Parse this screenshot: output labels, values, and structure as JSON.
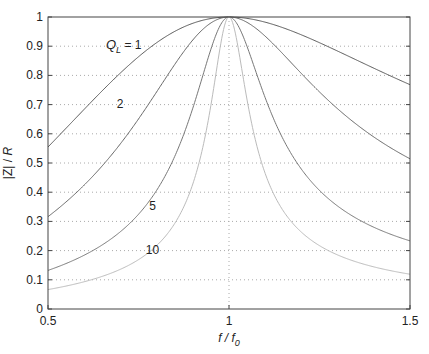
{
  "chart_data": {
    "type": "line",
    "title": "",
    "xlabel": "f / f0",
    "xlabel_main": "f / f",
    "xlabel_sub": "0",
    "ylabel": "|Z| / R",
    "xlim": [
      0.5,
      1.5
    ],
    "ylim": [
      0,
      1
    ],
    "grid": true,
    "legend_position": "inline labels",
    "x_ticks": [
      0.5,
      1,
      1.5
    ],
    "x_tick_labels": [
      "0.5",
      "1",
      "1.5"
    ],
    "y_ticks": [
      0,
      0.1,
      0.2,
      0.3,
      0.4,
      0.5,
      0.6,
      0.7,
      0.8,
      0.9,
      1
    ],
    "y_tick_labels": [
      "0",
      "0.1",
      "0.2",
      "0.3",
      "0.4",
      "0.5",
      "0.6",
      "0.7",
      "0.8",
      "0.9",
      "1"
    ],
    "x": [
      0.5,
      0.6,
      0.7,
      0.8,
      0.9,
      1.0,
      1.1,
      1.2,
      1.3,
      1.4,
      1.5
    ],
    "series": [
      {
        "name": "Q_L = 1",
        "label": "1",
        "Q": 1,
        "color": "#555555",
        "values": [
          0.555,
          0.669,
          0.799,
          0.923,
          0.989,
          1.0,
          0.992,
          0.964,
          0.918,
          0.859,
          0.768
        ]
      },
      {
        "name": "Q_L = 2",
        "label": "2",
        "Q": 2,
        "color": "#666666",
        "values": [
          0.316,
          0.428,
          0.557,
          0.748,
          0.927,
          1.0,
          0.935,
          0.771,
          0.64,
          0.532,
          0.514
        ]
      },
      {
        "name": "Q_L = 5",
        "label": "5",
        "Q": 5,
        "color": "#777777",
        "values": [
          0.132,
          0.187,
          0.27,
          0.421,
          0.689,
          1.0,
          0.722,
          0.497,
          0.326,
          0.255,
          0.233
        ]
      },
      {
        "name": "Q_L = 10",
        "label": "10",
        "Q": 10,
        "color": "#bbbbbb",
        "values": [
          0.066,
          0.094,
          0.139,
          0.229,
          0.426,
          1.0,
          0.463,
          0.259,
          0.191,
          0.139,
          0.119
        ]
      }
    ],
    "annotations": [
      {
        "text_main": "Q",
        "text_sub": "L",
        "text_rest": " = 1",
        "x": 0.66,
        "y": 0.89
      },
      {
        "text": "2",
        "x": 0.69,
        "y": 0.69
      },
      {
        "text": "5",
        "x": 0.78,
        "y": 0.34
      },
      {
        "text": "10",
        "x": 0.77,
        "y": 0.19
      }
    ]
  }
}
